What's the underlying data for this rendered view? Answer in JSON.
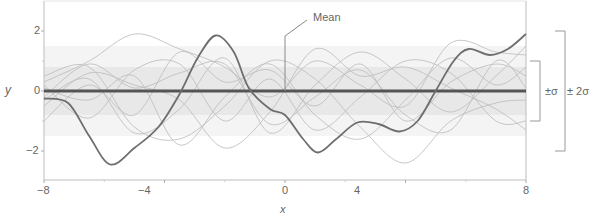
{
  "chart_data": {
    "type": "line",
    "title": "",
    "xlabel": "x",
    "ylabel": "y",
    "xlim": [
      -8,
      8
    ],
    "ylim": [
      -3,
      3
    ],
    "x_ticks": [
      -8,
      -4,
      0,
      4,
      8
    ],
    "x_tick_labels": [
      "−8",
      "−4",
      "0",
      "4",
      "8"
    ],
    "y_ticks": [
      -2,
      0,
      2
    ],
    "y_tick_labels": [
      "−2",
      "0",
      "2"
    ],
    "grid": false,
    "bands": [
      {
        "name": "±2σ",
        "lower": -1.5,
        "upper": 1.5,
        "color": "#f4f4f4"
      },
      {
        "name": "±σ",
        "lower": -0.8,
        "upper": 0.8,
        "color": "#e8e8e8"
      }
    ],
    "series": [
      {
        "name": "Mean",
        "style": "thick-dark",
        "color": "#555555",
        "x": [
          -8,
          8
        ],
        "values": [
          0,
          0
        ]
      },
      {
        "name": "Highlighted sample",
        "style": "dark",
        "color": "#6e6e6e",
        "x": [
          -8,
          -7.2,
          -6.5,
          -5.8,
          -5,
          -4.2,
          -3.5,
          -2.9,
          -2.3,
          -1.7,
          -1.2,
          -0.5,
          0,
          0.6,
          1.1,
          1.7,
          2.4,
          3.1,
          3.8,
          4.4,
          5,
          5.6,
          6.1,
          6.8,
          7.4,
          8
        ],
        "values": [
          -0.25,
          -0.4,
          -1.5,
          -2.45,
          -1.9,
          -1.2,
          -0.1,
          1.1,
          1.85,
          1.3,
          0.1,
          -0.6,
          -0.8,
          -1.6,
          -2.05,
          -1.6,
          -1.05,
          -1.1,
          -1.35,
          -1.0,
          0.0,
          1.0,
          1.4,
          1.2,
          1.4,
          1.9
        ]
      },
      {
        "name": "Sample 2",
        "style": "light",
        "color": "#bdbdbd",
        "x": [
          -8,
          -6.5,
          -5,
          -3.5,
          -2,
          -0.5,
          1,
          2.5,
          4,
          5.5,
          7,
          8
        ],
        "values": [
          0.3,
          1.0,
          1.9,
          1.4,
          0.8,
          -0.2,
          1.0,
          0.2,
          -0.5,
          1.6,
          1.3,
          1.2
        ]
      },
      {
        "name": "Sample 3",
        "style": "light",
        "color": "#bdbdbd",
        "x": [
          -8,
          -6.5,
          -5,
          -3.5,
          -2,
          -0.5,
          1,
          2.5,
          4,
          5.5,
          7,
          8
        ],
        "values": [
          -1.0,
          0.2,
          -0.8,
          1.3,
          0.3,
          0.7,
          -0.5,
          0.9,
          -1.0,
          0.3,
          0.9,
          0.5
        ]
      },
      {
        "name": "Sample 4",
        "style": "light",
        "color": "#bdbdbd",
        "x": [
          -8,
          -6.5,
          -5,
          -3.5,
          -2,
          -0.5,
          1,
          2.5,
          4,
          5.5,
          7,
          8
        ],
        "values": [
          0.5,
          0.8,
          -1.2,
          -1.6,
          -0.5,
          1.0,
          0.4,
          -1.2,
          -2.4,
          -1.0,
          -0.4,
          -0.3
        ]
      },
      {
        "name": "Sample 5",
        "style": "light",
        "color": "#bdbdbd",
        "x": [
          -8,
          -6.5,
          -5,
          -3.5,
          -2,
          -0.5,
          1,
          2.5,
          4,
          5.5,
          7,
          8
        ],
        "values": [
          -0.5,
          0.6,
          0.2,
          -0.3,
          -1.9,
          -0.7,
          1.4,
          0.5,
          0.8,
          0.1,
          -0.6,
          -1.3
        ]
      },
      {
        "name": "Sample 6",
        "style": "light",
        "color": "#bdbdbd",
        "x": [
          -8,
          -6.5,
          -5,
          -3.5,
          -2,
          -0.5,
          1,
          2.5,
          4,
          5.5,
          7,
          8
        ],
        "values": [
          0.2,
          -0.9,
          0.7,
          0.9,
          -1.0,
          0.4,
          -1.3,
          -0.2,
          1.0,
          0.6,
          -1.0,
          -1.0
        ]
      },
      {
        "name": "Sample 7",
        "style": "light",
        "color": "#bdbdbd",
        "x": [
          -8,
          -6.5,
          -5,
          -3.5,
          -2,
          -0.5,
          1,
          2.5,
          4,
          5.5,
          7,
          8
        ],
        "values": [
          -0.3,
          0.4,
          -1.4,
          -0.6,
          1.1,
          -1.4,
          0.2,
          1.3,
          0.4,
          -0.7,
          0.5,
          1.5
        ]
      },
      {
        "name": "Sample 8",
        "style": "light",
        "color": "#bdbdbd",
        "x": [
          -8,
          -6.5,
          -5,
          -3.5,
          -2,
          -0.5,
          1,
          2.5,
          4,
          5.5,
          7,
          8
        ],
        "values": [
          0.1,
          -0.3,
          0.5,
          -1.8,
          -0.2,
          0.9,
          -0.8,
          -1.6,
          -0.3,
          1.1,
          0.2,
          0.8
        ]
      },
      {
        "name": "Sample 9",
        "style": "light",
        "color": "#bdbdbd",
        "x": [
          -8,
          -6.5,
          -5,
          -3.5,
          -2,
          -0.5,
          1,
          2.5,
          4,
          5.5,
          7,
          8
        ],
        "values": [
          -0.2,
          0.9,
          0.1,
          0.6,
          0.9,
          -1.1,
          -0.2,
          0.7,
          -0.8,
          -1.3,
          1.0,
          0.1
        ]
      }
    ],
    "annotations": [
      {
        "text": "Mean",
        "target_x": 0,
        "target_y": 0
      },
      {
        "text": "±σ",
        "type": "bracket",
        "from": -1,
        "to": 1
      },
      {
        "text": "±2σ",
        "type": "bracket",
        "from": -2,
        "to": 2
      }
    ],
    "legend": null
  },
  "labels": {
    "xlabel": "x",
    "ylabel": "y",
    "mean": "Mean",
    "sigma1": "±σ",
    "sigma2": "± 2σ",
    "xticks": [
      "−8",
      "−4",
      "0",
      "4",
      "8"
    ],
    "yticks": [
      "2",
      "0",
      "−2"
    ]
  }
}
